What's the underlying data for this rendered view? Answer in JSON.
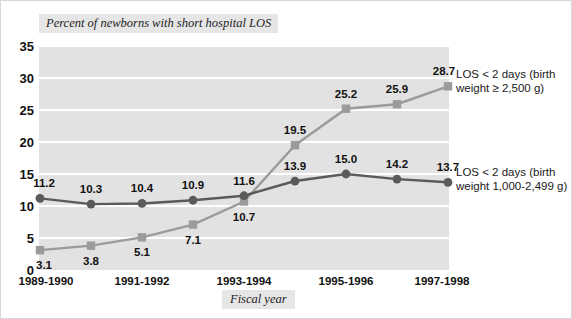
{
  "chart_data": {
    "type": "line",
    "title": "Percent of newborns with short hospital LOS",
    "xlabel": "Fiscal year",
    "ylabel": "",
    "ylim": [
      0,
      35
    ],
    "yticks": [
      0,
      5,
      10,
      15,
      20,
      25,
      30,
      35
    ],
    "grid": true,
    "legend_position": "right",
    "x": [
      "1989-1990",
      "",
      "1991-1992",
      "",
      "1993-1994",
      "",
      "1995-1996",
      "",
      "1997-1998"
    ],
    "xtick_labels": [
      "1989-1990",
      "1991-1992",
      "1993-1994",
      "1995-1996",
      "1997-1998"
    ],
    "xtick_indices": [
      0,
      2,
      4,
      6,
      8
    ],
    "series": [
      {
        "name": "LOS < 2 days (birth weight ≥ 2,500 g)",
        "legend_line1": "LOS < 2 days (birth",
        "legend_line2": "weight ≥ 2,500 g)",
        "color": "#9b9b9b",
        "marker": "square",
        "label_position": "below-then-above",
        "values": [
          3.1,
          3.8,
          5.1,
          7.1,
          10.7,
          19.5,
          25.2,
          25.9,
          28.7
        ]
      },
      {
        "name": "LOS < 2 days (birth weight 1,000-2,499 g)",
        "legend_line1": "LOS < 2 days (birth",
        "legend_line2": "weight 1,000-2,499 g)",
        "color": "#5a5a5a",
        "marker": "circle",
        "label_position": "above",
        "values": [
          11.2,
          10.3,
          10.4,
          10.9,
          11.6,
          13.9,
          15.0,
          14.2,
          13.7
        ]
      }
    ]
  },
  "colors": {
    "plot_background": "#e2e2e2",
    "gridline": "#ffffff",
    "band_background": "#e6e6e6",
    "text": "#111111",
    "series_upper": "#9b9b9b",
    "series_lower": "#5a5a5a"
  }
}
